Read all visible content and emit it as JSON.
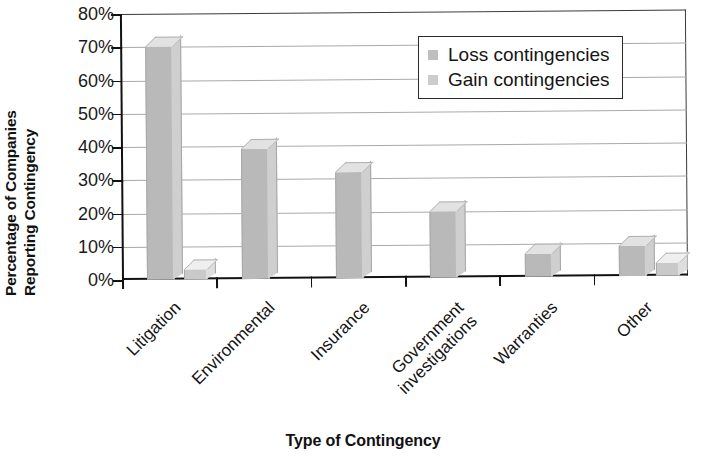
{
  "chart_data": {
    "type": "bar",
    "title": "",
    "subtitle": "",
    "xlabel": "Type of Contingency",
    "ylabel": "Percentage of Companies Reporting Contingency",
    "ylabel_lines": [
      "Percentage of Companies",
      "Reporting Contingency"
    ],
    "categories": [
      "Litigation",
      "Environmental",
      "Insurance",
      "Government investigations",
      "Warranties",
      "Other"
    ],
    "category_lines": [
      [
        "Litigation"
      ],
      [
        "Environmental"
      ],
      [
        "Insurance"
      ],
      [
        "Government",
        "investigations"
      ],
      [
        "Warranties"
      ],
      [
        "Other"
      ]
    ],
    "series": [
      {
        "name": "Loss contingencies",
        "values": [
          70,
          39,
          32,
          20,
          7,
          9
        ],
        "color": "#b9b9b9"
      },
      {
        "name": "Gain contingencies",
        "values": [
          3,
          0,
          0,
          0,
          0,
          4
        ],
        "color": "#c9c9c9"
      }
    ],
    "ylim": [
      0,
      80
    ],
    "yticks": [
      0,
      10,
      20,
      30,
      40,
      50,
      60,
      70,
      80
    ],
    "ytick_labels": [
      "0%",
      "10%",
      "20%",
      "30%",
      "40%",
      "50%",
      "60%",
      "70%",
      "80%"
    ],
    "grid": true,
    "grid_axis": "y",
    "legend_position": "upper right",
    "legend_entries": [
      "Loss contingencies",
      "Gain contingencies"
    ],
    "style_3d": true
  }
}
